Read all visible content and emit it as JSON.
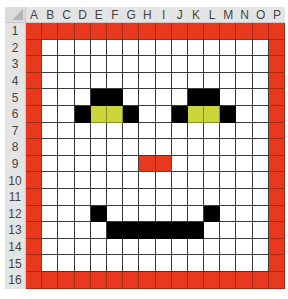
{
  "spreadsheet": {
    "columns": [
      "A",
      "B",
      "C",
      "D",
      "E",
      "F",
      "G",
      "H",
      "I",
      "J",
      "K",
      "L",
      "M",
      "N",
      "O",
      "P"
    ],
    "rows": [
      "1",
      "2",
      "3",
      "4",
      "5",
      "6",
      "7",
      "8",
      "9",
      "10",
      "11",
      "12",
      "13",
      "14",
      "15",
      "16"
    ],
    "colors": {
      "r": "#e8391e",
      "k": "#000000",
      "y": "#cbd53c",
      "w": "#ffffff"
    },
    "grid": [
      "rrrrrrrrrrrrrrrr",
      "rwwwwwwwwwwwwwwr",
      "rwwwwwwwwwwwwwwr",
      "rwwwwwwwwwwwwwwr",
      "rwwwkkwwwwkkwwwr",
      "rwwkyykwwkyykwwr",
      "rwwwwwwwwwwwwwwr",
      "rwwwwwwwwwwwwwwr",
      "rwwwwwwrrwwwwwwr",
      "rwwwwwwwwwwwwwwr",
      "rwwwwwwwwwwwwwwr",
      "rwwwkwwwwwwkwwwr",
      "rwwwwkkkkkkwwwwr",
      "rwwwwwwwwwwwwwwr",
      "rwwwwwwwwwwwwwwr",
      "rrrrrrrrrrrrrrrr"
    ]
  }
}
